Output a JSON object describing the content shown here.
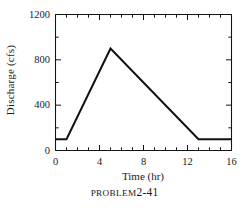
{
  "chart_data": {
    "type": "line",
    "title": "",
    "xlabel": "Time (hr)",
    "ylabel": "Discharge (cfs)",
    "xlim": [
      0,
      16
    ],
    "ylim": [
      0,
      1200
    ],
    "xticks": [
      0,
      4,
      8,
      12,
      16
    ],
    "yticks": [
      0,
      400,
      800,
      1200
    ],
    "xticklabels": [
      "0",
      "4",
      "8",
      "12",
      "16"
    ],
    "yticklabels": [
      "0",
      "400",
      "800",
      "1200"
    ],
    "x_minor_tick_interval": 1,
    "y_minor_tick_interval": 200,
    "grid": false,
    "legend": null,
    "series": [
      {
        "name": "Discharge hydrograph",
        "color": "#111111",
        "x": [
          0,
          1,
          5,
          13,
          16
        ],
        "values": [
          100,
          100,
          900,
          100,
          100
        ]
      }
    ],
    "annotations": []
  },
  "figure": {
    "caption_prefix": "PROBLEM",
    "caption_number": "2-41"
  },
  "axis_labels": {
    "y_title": "Discharge (cfs)",
    "x_title": "Time (hr)"
  }
}
